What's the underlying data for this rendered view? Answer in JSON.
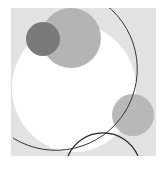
{
  "artwork": {
    "description": "Abstract composition of overlapping circles on a grey square",
    "background_color": "#e2e2e2",
    "shapes": [
      {
        "type": "ellipse",
        "fill": "#ffffff",
        "cx": 74,
        "cy": 80,
        "rx": 62,
        "ry": 64
      },
      {
        "type": "circle",
        "fill": "#b4b4b4",
        "cx": 60,
        "cy": 30,
        "r": 30
      },
      {
        "type": "circle",
        "fill": "#7a7a7a",
        "cx": 32,
        "cy": 31,
        "r": 17
      },
      {
        "type": "circle",
        "fill": "#b8b8b8",
        "cx": 122,
        "cy": 107,
        "r": 21
      },
      {
        "type": "arc",
        "stroke": "#333333",
        "description": "large thin arc"
      },
      {
        "type": "arc",
        "stroke": "#222222",
        "description": "small lower arc"
      }
    ]
  }
}
